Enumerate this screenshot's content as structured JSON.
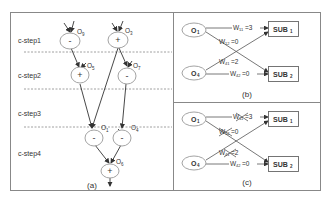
{
  "panel_a": {
    "caption": "(a)",
    "csteps": [
      "c-step1",
      "c-step2",
      "c-step3",
      "c-step4"
    ],
    "nodes": [
      {
        "id": "O9",
        "name": "O",
        "sub": "9",
        "op": "-"
      },
      {
        "id": "O3",
        "name": "O",
        "sub": "3",
        "op": "+"
      },
      {
        "id": "O5",
        "name": "O",
        "sub": "5",
        "op": "+"
      },
      {
        "id": "O7",
        "name": "O",
        "sub": "7",
        "op": "-"
      },
      {
        "id": "O1",
        "name": "O",
        "sub": "1",
        "op": "-"
      },
      {
        "id": "O4",
        "name": "O",
        "sub": "4",
        "op": "-"
      },
      {
        "id": "O6",
        "name": "O",
        "sub": "6",
        "op": "+"
      }
    ]
  },
  "panel_b": {
    "caption": "(b)",
    "ops": [
      {
        "name": "O",
        "sub": "1"
      },
      {
        "name": "O",
        "sub": "4"
      }
    ],
    "subs": [
      {
        "name": "SUB",
        "sub": "1"
      },
      {
        "name": "SUB",
        "sub": "2"
      }
    ],
    "weights": [
      {
        "w": "W",
        "sub": "11",
        "val": "=3"
      },
      {
        "w": "W",
        "sub": "12",
        "val": "=0"
      },
      {
        "w": "W",
        "sub": "41",
        "val": "=2"
      },
      {
        "w": "W",
        "sub": "42",
        "val": "=0"
      }
    ]
  },
  "panel_c": {
    "caption": "(c)",
    "ops": [
      {
        "name": "O",
        "sub": "1"
      },
      {
        "name": "O",
        "sub": "4"
      }
    ],
    "subs": [
      {
        "name": "SUB",
        "sub": "1"
      },
      {
        "name": "SUB",
        "sub": "2"
      }
    ],
    "weights": [
      {
        "w": "W",
        "sub": "11",
        "val": "=3",
        "crossed": true
      },
      {
        "w": "W",
        "sub": "12",
        "val": "=0",
        "crossed": true
      },
      {
        "w": "W",
        "sub": "41",
        "val": "=2",
        "crossed": true
      },
      {
        "w": "W",
        "sub": "42",
        "val": "=0",
        "crossed": false
      }
    ]
  }
}
